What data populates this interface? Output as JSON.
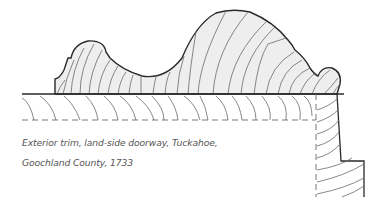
{
  "figure": {
    "type": "architectural-moulding-profile",
    "caption_lines": [
      "Exterior trim, land-side doorway, Tuckahoe,",
      "Goochland County, 1733"
    ],
    "colors": {
      "outline": "#2a2a2a",
      "grain": "#6a6a6a",
      "fill": "#eeeeee",
      "caption": "#555555"
    }
  }
}
